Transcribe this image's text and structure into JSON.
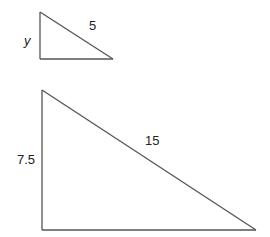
{
  "diagram": {
    "small_triangle": {
      "labels": {
        "vertical_leg": "y",
        "hypotenuse": "5"
      }
    },
    "large_triangle": {
      "labels": {
        "vertical_leg": "7.5",
        "hypotenuse": "15"
      }
    },
    "colors": {
      "line": "#555555",
      "text": "#222222",
      "background": "#ffffff"
    }
  }
}
